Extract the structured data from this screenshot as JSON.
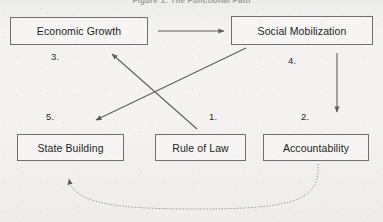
{
  "figure": {
    "title": "Figure 1: The Functional Path",
    "background_color": "#f2f1ef",
    "line_color": "#6f6f6d",
    "text_color": "#1d1d1b"
  },
  "nodes": [
    {
      "id": "economic-growth",
      "label": "Economic Growth"
    },
    {
      "id": "social-mobilization",
      "label": "Social Mobilization"
    },
    {
      "id": "state-building",
      "label": "State Building"
    },
    {
      "id": "rule-of-law",
      "label": "Rule of Law"
    },
    {
      "id": "accountability",
      "label": "Accountability"
    }
  ],
  "edge_labels": [
    {
      "id": "label-1",
      "text": "1."
    },
    {
      "id": "label-2",
      "text": "2."
    },
    {
      "id": "label-3",
      "text": "3."
    },
    {
      "id": "label-4",
      "text": "4."
    },
    {
      "id": "label-5",
      "text": "5."
    }
  ],
  "edges": [
    {
      "id": "edge-growth-to-mobilization",
      "from": "Economic Growth",
      "to": "Social Mobilization",
      "style": "solid",
      "number": ""
    },
    {
      "id": "edge-rule-of-law-to-growth",
      "from": "Rule of Law",
      "to": "Economic Growth",
      "style": "solid",
      "number": "1."
    },
    {
      "id": "edge-mobilization-to-accountability",
      "from": "Social Mobilization",
      "to": "Accountability",
      "style": "solid",
      "number": "2."
    },
    {
      "id": "edge-mobilization-to-state-building",
      "from": "Social Mobilization",
      "to": "State Building",
      "style": "solid",
      "number": "5."
    },
    {
      "id": "edge-accountability-to-state-building",
      "from": "Accountability",
      "to": "State Building",
      "style": "dashed",
      "number": ""
    }
  ]
}
